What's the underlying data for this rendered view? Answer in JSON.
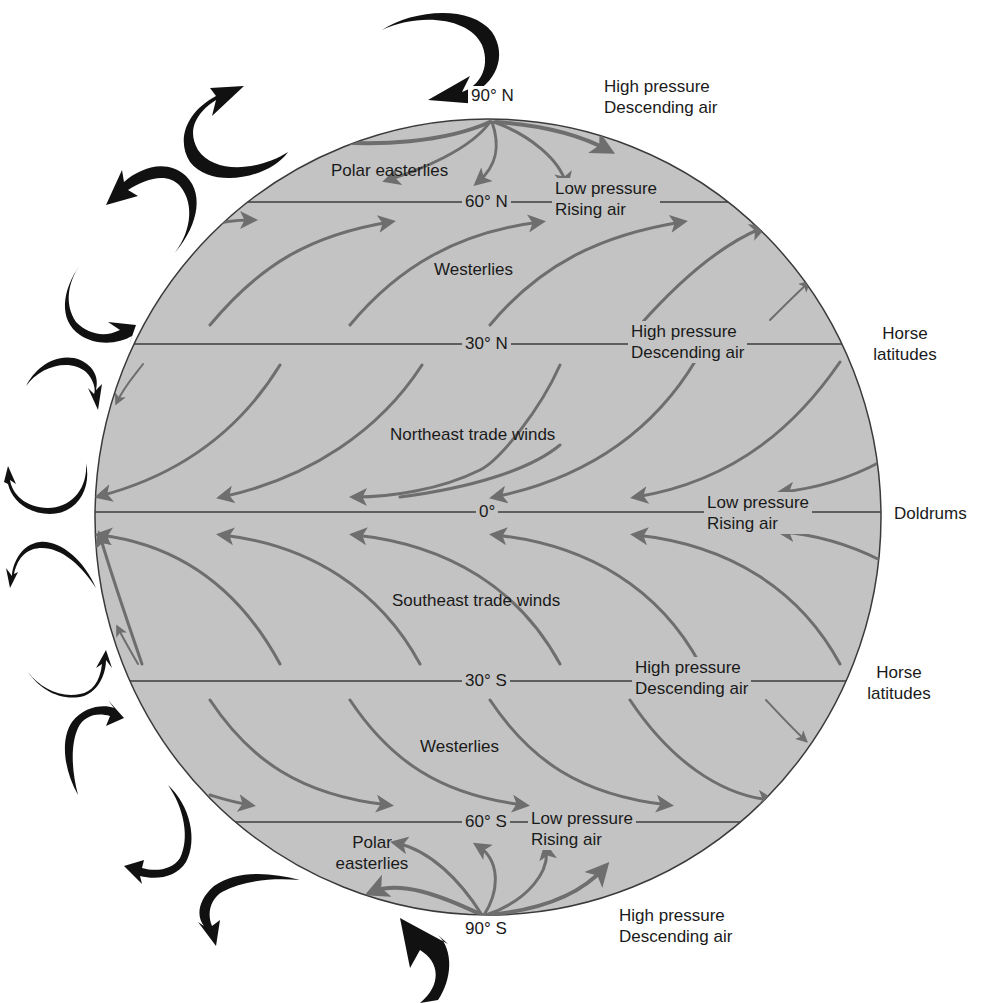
{
  "diagram": {
    "colors": {
      "globe_fill": "#c3c3c3",
      "globe_outline": "#3a3a3a",
      "latitude_line": "#3c3c3c",
      "surface_wind_arrow": "#6e6e6e",
      "circulation_arrow": "#111111",
      "text": "#1a1a1a"
    },
    "latitudes": [
      {
        "id": "90N",
        "label": "90° N"
      },
      {
        "id": "60N",
        "label": "60° N"
      },
      {
        "id": "30N",
        "label": "30° N"
      },
      {
        "id": "0",
        "label": "0°"
      },
      {
        "id": "30S",
        "label": "30° S"
      },
      {
        "id": "60S",
        "label": "60° S"
      },
      {
        "id": "90S",
        "label": "90° S"
      }
    ],
    "wind_belts": {
      "polar_easterlies_north": "Polar easterlies",
      "westerlies_north": "Westerlies",
      "northeast_trades": "Northeast trade winds",
      "southeast_trades": "Southeast trade winds",
      "westerlies_south": "Westerlies",
      "polar_easterlies_south_line1": "Polar",
      "polar_easterlies_south_line2": "easterlies"
    },
    "pressure_zones": {
      "north_pole": {
        "line1": "High pressure",
        "line2": "Descending air"
      },
      "lat_60N": {
        "line1": "Low pressure",
        "line2": "Rising air"
      },
      "lat_30N": {
        "line1": "High pressure",
        "line2": "Descending air"
      },
      "equator": {
        "line1": "Low pressure",
        "line2": "Rising air"
      },
      "lat_30S": {
        "line1": "High pressure",
        "line2": "Descending air"
      },
      "lat_60S": {
        "line1": "Low pressure",
        "line2": "Rising air"
      },
      "south_pole": {
        "line1": "High pressure",
        "line2": "Descending air"
      }
    },
    "side_labels": {
      "horse_latitudes_north": {
        "line1": "Horse",
        "line2": "latitudes"
      },
      "doldrums": "Doldrums",
      "horse_latitudes_south": {
        "line1": "Horse",
        "line2": "latitudes"
      }
    }
  }
}
